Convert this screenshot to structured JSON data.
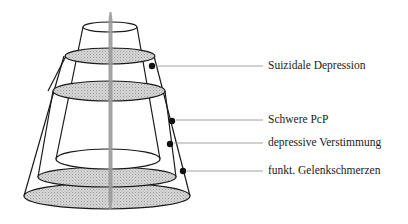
{
  "diagram": {
    "type": "nested-cone-layers",
    "labels": [
      {
        "id": "suicidal",
        "text": "Suizidale Depression",
        "dot": [
          152,
          66
        ],
        "line_y": 66,
        "text_x": 268,
        "text_y": 59
      },
      {
        "id": "pcp",
        "text": "Schwere PcP",
        "dot": [
          172,
          121
        ],
        "line_y": 120,
        "text_x": 268,
        "text_y": 114
      },
      {
        "id": "depressive",
        "text": "depressive Verstimmung",
        "dot": [
          170,
          144
        ],
        "line_y": 143,
        "text_x": 268,
        "text_y": 137
      },
      {
        "id": "joint-pain",
        "text": "funkt. Gelenkschmerzen",
        "dot": [
          183,
          171
        ],
        "line_y": 171,
        "text_x": 268,
        "text_y": 165
      }
    ],
    "colors": {
      "outline": "#1a1a1a",
      "fill_shaded": "#cfcfcf",
      "pole": "#9a9a9a",
      "leader_line": "#8a8a8a"
    }
  }
}
